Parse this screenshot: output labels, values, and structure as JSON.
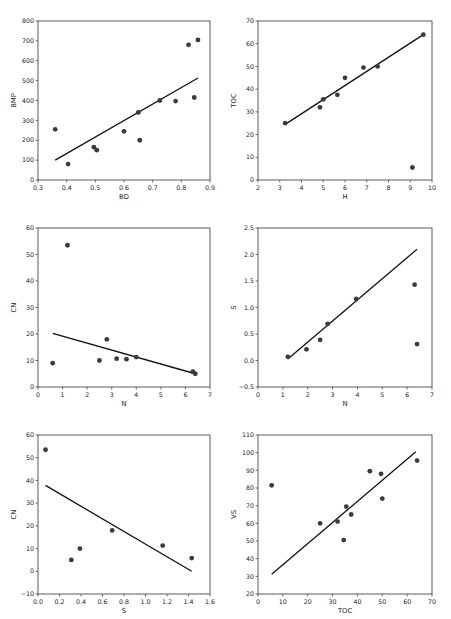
{
  "figure": {
    "rows": 3,
    "cols": 2,
    "marker_color": "#3a3a3a",
    "line_color": "#111111",
    "frame_color": "#333333"
  },
  "chart_data": [
    {
      "type": "scatter",
      "title": "",
      "xlabel": "BD",
      "ylabel": "BMP",
      "xlim": [
        0.3,
        0.9
      ],
      "ylim": [
        0,
        800
      ],
      "xticks": [
        "0.3",
        "0.4",
        "0.5",
        "0.6",
        "0.7",
        "0.8",
        "0.9"
      ],
      "yticks": [
        "0",
        "100",
        "200",
        "300",
        "400",
        "500",
        "600",
        "700",
        "800"
      ],
      "grid": false,
      "legend": null,
      "points": [
        {
          "x": 0.36,
          "y": 255
        },
        {
          "x": 0.405,
          "y": 80
        },
        {
          "x": 0.495,
          "y": 165
        },
        {
          "x": 0.505,
          "y": 150
        },
        {
          "x": 0.6,
          "y": 245
        },
        {
          "x": 0.65,
          "y": 340
        },
        {
          "x": 0.655,
          "y": 200
        },
        {
          "x": 0.725,
          "y": 400
        },
        {
          "x": 0.78,
          "y": 397
        },
        {
          "x": 0.825,
          "y": 680
        },
        {
          "x": 0.845,
          "y": 415
        },
        {
          "x": 0.858,
          "y": 705
        }
      ],
      "fit_line": [
        {
          "x": 0.36,
          "y": 100
        },
        {
          "x": 0.858,
          "y": 513
        }
      ]
    },
    {
      "type": "scatter",
      "title": "",
      "xlabel": "H",
      "ylabel": "TOC",
      "xlim": [
        2,
        10
      ],
      "ylim": [
        0,
        70
      ],
      "xticks": [
        "2",
        "3",
        "4",
        "5",
        "6",
        "7",
        "8",
        "9",
        "10"
      ],
      "yticks": [
        "0",
        "10",
        "20",
        "30",
        "40",
        "50",
        "60",
        "70"
      ],
      "grid": false,
      "legend": null,
      "points": [
        {
          "x": 3.25,
          "y": 25
        },
        {
          "x": 4.85,
          "y": 32
        },
        {
          "x": 5.0,
          "y": 35.5
        },
        {
          "x": 5.65,
          "y": 37.5
        },
        {
          "x": 6.0,
          "y": 45
        },
        {
          "x": 6.85,
          "y": 49.5
        },
        {
          "x": 7.5,
          "y": 50
        },
        {
          "x": 9.1,
          "y": 5.5
        },
        {
          "x": 9.6,
          "y": 64
        }
      ],
      "fit_line": [
        {
          "x": 3.25,
          "y": 24.5
        },
        {
          "x": 9.6,
          "y": 64
        }
      ]
    },
    {
      "type": "scatter",
      "title": "",
      "xlabel": "N",
      "ylabel": "CN",
      "xlim": [
        0,
        7
      ],
      "ylim": [
        0,
        60
      ],
      "xticks": [
        "0",
        "1",
        "2",
        "3",
        "4",
        "5",
        "6",
        "7"
      ],
      "yticks": [
        "0",
        "10",
        "20",
        "30",
        "40",
        "50",
        "60"
      ],
      "grid": false,
      "legend": null,
      "points": [
        {
          "x": 0.6,
          "y": 9
        },
        {
          "x": 1.2,
          "y": 53.5
        },
        {
          "x": 2.5,
          "y": 10
        },
        {
          "x": 2.8,
          "y": 18
        },
        {
          "x": 3.2,
          "y": 10.7
        },
        {
          "x": 3.6,
          "y": 10.5
        },
        {
          "x": 4.0,
          "y": 11.3
        },
        {
          "x": 6.3,
          "y": 5.8
        },
        {
          "x": 6.4,
          "y": 5
        }
      ],
      "fit_line": [
        {
          "x": 0.6,
          "y": 20.2
        },
        {
          "x": 6.4,
          "y": 5
        }
      ]
    },
    {
      "type": "scatter",
      "title": "",
      "xlabel": "N",
      "ylabel": "S",
      "xlim": [
        0,
        7
      ],
      "ylim": [
        -0.5,
        2.5
      ],
      "xticks": [
        "0",
        "1",
        "2",
        "3",
        "4",
        "5",
        "6",
        "7"
      ],
      "yticks": [
        "−0.5",
        "0.0",
        "0.5",
        "1.0",
        "1.5",
        "2.0",
        "2.5"
      ],
      "grid": false,
      "legend": null,
      "points": [
        {
          "x": 1.2,
          "y": 0.07
        },
        {
          "x": 1.95,
          "y": 0.21
        },
        {
          "x": 2.5,
          "y": 0.39
        },
        {
          "x": 2.8,
          "y": 0.69
        },
        {
          "x": 3.95,
          "y": 1.16
        },
        {
          "x": 6.3,
          "y": 1.43
        },
        {
          "x": 6.4,
          "y": 0.31
        }
      ],
      "fit_line": [
        {
          "x": 1.2,
          "y": 0.03
        },
        {
          "x": 6.4,
          "y": 2.1
        }
      ]
    },
    {
      "type": "scatter",
      "title": "",
      "xlabel": "S",
      "ylabel": "CN",
      "xlim": [
        0.0,
        1.6
      ],
      "ylim": [
        -10,
        60
      ],
      "xticks": [
        "0.0",
        "0.2",
        "0.4",
        "0.6",
        "0.8",
        "1.0",
        "1.2",
        "1.4",
        "1.6"
      ],
      "yticks": [
        "−10",
        "0",
        "10",
        "20",
        "30",
        "40",
        "50",
        "60"
      ],
      "grid": false,
      "legend": null,
      "points": [
        {
          "x": 0.07,
          "y": 53.5
        },
        {
          "x": 0.31,
          "y": 5
        },
        {
          "x": 0.39,
          "y": 10
        },
        {
          "x": 0.69,
          "y": 18
        },
        {
          "x": 1.16,
          "y": 11.3
        },
        {
          "x": 1.43,
          "y": 5.8
        }
      ],
      "fit_line": [
        {
          "x": 0.07,
          "y": 37.8
        },
        {
          "x": 1.43,
          "y": 0
        }
      ]
    },
    {
      "type": "scatter",
      "title": "",
      "xlabel": "TOC",
      "ylabel": "VS",
      "xlim": [
        0,
        70
      ],
      "ylim": [
        20,
        110
      ],
      "xticks": [
        "0",
        "10",
        "20",
        "30",
        "40",
        "50",
        "60",
        "70"
      ],
      "yticks": [
        "20",
        "30",
        "40",
        "50",
        "60",
        "70",
        "80",
        "90",
        "100",
        "110"
      ],
      "grid": false,
      "legend": null,
      "points": [
        {
          "x": 5.5,
          "y": 81.5
        },
        {
          "x": 25,
          "y": 60
        },
        {
          "x": 32,
          "y": 61
        },
        {
          "x": 34.5,
          "y": 50.5
        },
        {
          "x": 35.5,
          "y": 69.5
        },
        {
          "x": 37.5,
          "y": 65
        },
        {
          "x": 45,
          "y": 89.5
        },
        {
          "x": 49.5,
          "y": 88
        },
        {
          "x": 50,
          "y": 74
        },
        {
          "x": 64,
          "y": 95.5
        }
      ],
      "fit_line": [
        {
          "x": 5.5,
          "y": 31.2
        },
        {
          "x": 63.5,
          "y": 100.5
        }
      ]
    }
  ]
}
